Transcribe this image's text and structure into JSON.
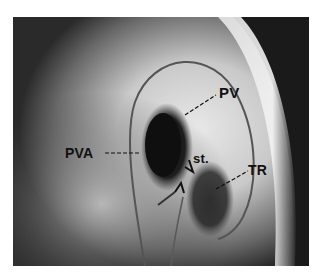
{
  "figure": {
    "type": "angiogram",
    "labels": {
      "pv": "PV",
      "pva": "PVA",
      "st": "st.",
      "tr": "TR"
    }
  }
}
